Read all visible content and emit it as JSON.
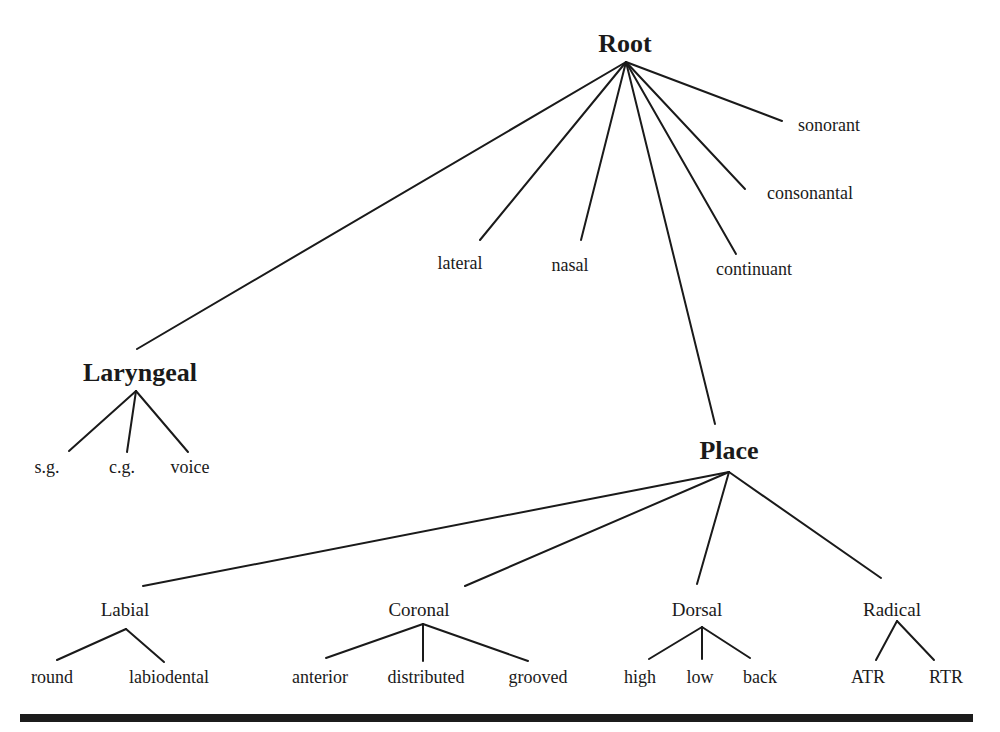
{
  "diagram": {
    "type": "feature-geometry-tree",
    "colors": {
      "line": "#1a1a1a",
      "text": "#1a1a1a",
      "background": "#ffffff",
      "rule": "#1c1c1c"
    },
    "nodes": {
      "root": "Root",
      "sonorant": "sonorant",
      "consonantal": "consonantal",
      "continuant": "continuant",
      "lateral": "lateral",
      "nasal": "nasal",
      "laryngeal": "Laryngeal",
      "sg": "s.g.",
      "cg": "c.g.",
      "voice": "voice",
      "place": "Place",
      "labial": "Labial",
      "round": "round",
      "labiodental": "labiodental",
      "coronal": "Coronal",
      "anterior": "anterior",
      "distributed": "distributed",
      "grooved": "grooved",
      "dorsal": "Dorsal",
      "high": "high",
      "low": "low",
      "back": "back",
      "radical": "Radical",
      "atr": "ATR",
      "rtr": "RTR"
    },
    "edges": [
      [
        "Root",
        "Laryngeal"
      ],
      [
        "Root",
        "lateral"
      ],
      [
        "Root",
        "nasal"
      ],
      [
        "Root",
        "Place"
      ],
      [
        "Root",
        "continuant"
      ],
      [
        "Root",
        "consonantal"
      ],
      [
        "Root",
        "sonorant"
      ],
      [
        "Laryngeal",
        "s.g."
      ],
      [
        "Laryngeal",
        "c.g."
      ],
      [
        "Laryngeal",
        "voice"
      ],
      [
        "Place",
        "Labial"
      ],
      [
        "Place",
        "Coronal"
      ],
      [
        "Place",
        "Dorsal"
      ],
      [
        "Place",
        "Radical"
      ],
      [
        "Labial",
        "round"
      ],
      [
        "Labial",
        "labiodental"
      ],
      [
        "Coronal",
        "anterior"
      ],
      [
        "Coronal",
        "distributed"
      ],
      [
        "Coronal",
        "grooved"
      ],
      [
        "Dorsal",
        "high"
      ],
      [
        "Dorsal",
        "low"
      ],
      [
        "Dorsal",
        "back"
      ],
      [
        "Radical",
        "ATR"
      ],
      [
        "Radical",
        "RTR"
      ]
    ]
  }
}
